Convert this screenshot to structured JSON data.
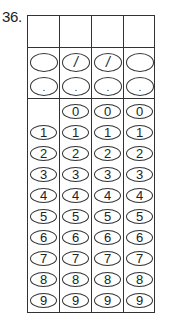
{
  "question": {
    "number_label": "36."
  },
  "grid": {
    "columns": 4,
    "answer_boxes": [
      "",
      "",
      "",
      ""
    ],
    "fraction_row": {
      "label": "fraction bar",
      "cells": [
        "",
        "/",
        "/",
        ""
      ]
    },
    "decimal_row": {
      "label": "decimal point",
      "cells": [
        ".",
        ".",
        ".",
        "."
      ]
    },
    "digit_rows": [
      {
        "digit": "0",
        "cells": [
          "",
          "0",
          "0",
          "0"
        ]
      },
      {
        "digit": "1",
        "cells": [
          "1",
          "1",
          "1",
          "1"
        ]
      },
      {
        "digit": "2",
        "cells": [
          "2",
          "2",
          "2",
          "2"
        ]
      },
      {
        "digit": "3",
        "cells": [
          "3",
          "3",
          "3",
          "3"
        ]
      },
      {
        "digit": "4",
        "cells": [
          "4",
          "4",
          "4",
          "4"
        ]
      },
      {
        "digit": "5",
        "cells": [
          "5",
          "5",
          "5",
          "5"
        ]
      },
      {
        "digit": "6",
        "cells": [
          "6",
          "6",
          "6",
          "6"
        ]
      },
      {
        "digit": "7",
        "cells": [
          "7",
          "7",
          "7",
          "7"
        ]
      },
      {
        "digit": "8",
        "cells": [
          "8",
          "8",
          "8",
          "8"
        ]
      },
      {
        "digit": "9",
        "cells": [
          "9",
          "9",
          "9",
          "9"
        ]
      }
    ]
  },
  "colors": {
    "line": "#333333",
    "background": "#ffffff",
    "text": "#222222"
  }
}
